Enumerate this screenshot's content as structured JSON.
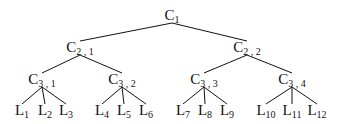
{
  "diagram": {
    "type": "tree",
    "root": {
      "id": "C1",
      "base": "C",
      "sub": "1",
      "x": 172,
      "y": 8
    },
    "nodes": [
      {
        "id": "C1",
        "base": "C",
        "sub": "1",
        "x": 172,
        "y": 8
      },
      {
        "id": "C21",
        "base": "C",
        "sub": "2 , 1",
        "x": 80,
        "y": 40
      },
      {
        "id": "C22",
        "base": "C",
        "sub": "2 , 2",
        "x": 247,
        "y": 40
      },
      {
        "id": "C31",
        "base": "C",
        "sub": "3 , 1",
        "x": 42,
        "y": 72
      },
      {
        "id": "C32",
        "base": "C",
        "sub": "3 , 2",
        "x": 122,
        "y": 72
      },
      {
        "id": "C33",
        "base": "C",
        "sub": "3 , 3",
        "x": 204,
        "y": 72
      },
      {
        "id": "C34",
        "base": "C",
        "sub": "3 , 4",
        "x": 292,
        "y": 72
      },
      {
        "id": "L1",
        "base": "L",
        "sub": "1",
        "x": 22,
        "y": 103
      },
      {
        "id": "L2",
        "base": "L",
        "sub": "2",
        "x": 45,
        "y": 103
      },
      {
        "id": "L3",
        "base": "L",
        "sub": "3",
        "x": 66,
        "y": 103
      },
      {
        "id": "L4",
        "base": "L",
        "sub": "4",
        "x": 102,
        "y": 103
      },
      {
        "id": "L5",
        "base": "L",
        "sub": "5",
        "x": 124,
        "y": 103
      },
      {
        "id": "L6",
        "base": "L",
        "sub": "6",
        "x": 146,
        "y": 103
      },
      {
        "id": "L7",
        "base": "L",
        "sub": "7",
        "x": 183,
        "y": 103
      },
      {
        "id": "L8",
        "base": "L",
        "sub": "8",
        "x": 205,
        "y": 103
      },
      {
        "id": "L9",
        "base": "L",
        "sub": "9",
        "x": 227,
        "y": 103
      },
      {
        "id": "L10",
        "base": "L",
        "sub": "10",
        "x": 266,
        "y": 103
      },
      {
        "id": "L11",
        "base": "L",
        "sub": "11",
        "x": 292,
        "y": 103
      },
      {
        "id": "L12",
        "base": "L",
        "sub": "12",
        "x": 317,
        "y": 103
      }
    ],
    "edges": [
      [
        "C1",
        "C21"
      ],
      [
        "C1",
        "C22"
      ],
      [
        "C21",
        "C31"
      ],
      [
        "C21",
        "C32"
      ],
      [
        "C22",
        "C33"
      ],
      [
        "C22",
        "C34"
      ],
      [
        "C31",
        "L1"
      ],
      [
        "C31",
        "L2"
      ],
      [
        "C31",
        "L3"
      ],
      [
        "C32",
        "L4"
      ],
      [
        "C32",
        "L5"
      ],
      [
        "C32",
        "L6"
      ],
      [
        "C33",
        "L7"
      ],
      [
        "C33",
        "L8"
      ],
      [
        "C33",
        "L9"
      ],
      [
        "C34",
        "L10"
      ],
      [
        "C34",
        "L11"
      ],
      [
        "C34",
        "L12"
      ]
    ]
  }
}
